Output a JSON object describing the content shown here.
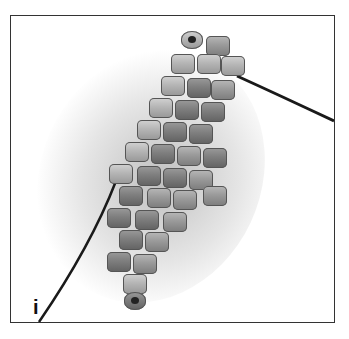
{
  "image": {
    "description": "Photo of beaded peyote-stitch diamond with thread tails",
    "panel_label": "i",
    "colors": {
      "frame": "#333333",
      "background": "#ffffff",
      "bead": "#9a9a9a",
      "thread": "#1a1a1a"
    }
  }
}
